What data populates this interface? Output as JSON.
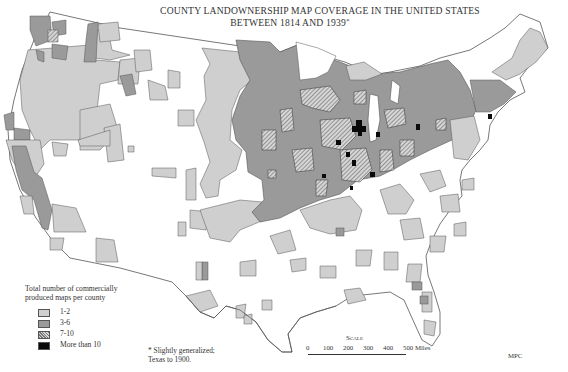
{
  "title": {
    "line1": "COUNTY LANDOWNERSHIP MAP COVERAGE IN THE UNITED STATES",
    "line2": "BETWEEN 1814 AND 1939",
    "line2_marker": "*"
  },
  "legend": {
    "heading": "Total number of commercially produced maps per county",
    "items": [
      {
        "label": "1-2",
        "color": "#cfcfcf",
        "pattern": "solid-light"
      },
      {
        "label": "3-6",
        "color": "#9a9a9a",
        "pattern": "solid-medium"
      },
      {
        "label": "7-10",
        "color": "#b0b0b0",
        "pattern": "crosshatch"
      },
      {
        "label": "More than 10",
        "color": "#0a0a0a",
        "pattern": "solid-black"
      }
    ]
  },
  "footnote": {
    "line1": "* Slightly generalized;",
    "line2": "Texas to 1900."
  },
  "scale": {
    "label": "Scale",
    "ticks": [
      "0",
      "100",
      "200",
      "300",
      "400",
      "500 Miles"
    ]
  },
  "credit": "MPC",
  "colors": {
    "background": "#ffffff",
    "outline": "#444444",
    "class_1_2": "#cfcfcf",
    "class_3_6": "#9a9a9a",
    "class_7_10": "crosshatch",
    "class_gt10": "#0a0a0a"
  }
}
